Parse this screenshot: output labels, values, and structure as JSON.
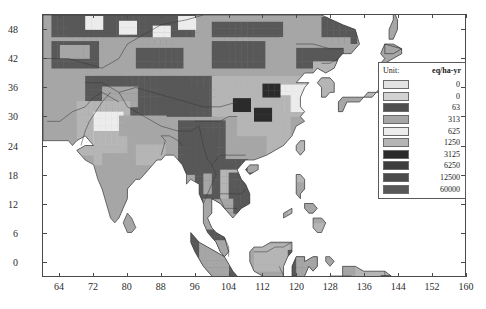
{
  "chart_data": {
    "type": "heatmap",
    "title": "",
    "subtitle": "",
    "xlabel": "",
    "ylabel": "",
    "xlim": [
      60,
      160
    ],
    "ylim": [
      -3,
      51
    ],
    "x_ticks": [
      "64",
      "72",
      "80",
      "88",
      "96",
      "104",
      "112",
      "120",
      "128",
      "136",
      "144",
      "152",
      "160"
    ],
    "y_ticks": [
      "0",
      "6",
      "12",
      "18",
      "24",
      "30",
      "36",
      "42",
      "48"
    ],
    "grid": false,
    "legend_position": "inside-top-right",
    "region": "Asia",
    "legend": {
      "unit_label": "Unit:",
      "unit_value": "eq/ha-yr",
      "entries": [
        {
          "value": "0",
          "color": "#e2e2e2"
        },
        {
          "value": "0",
          "color": "#d2d2d2"
        },
        {
          "value": "63",
          "color": "#4f4f4f"
        },
        {
          "value": "313",
          "color": "#a6a6a6"
        },
        {
          "value": "625",
          "color": "#ececec"
        },
        {
          "value": "1250",
          "color": "#b5b5b5"
        },
        {
          "value": "3125",
          "color": "#2b2b2b"
        },
        {
          "value": "6250",
          "color": "#3d3d3d"
        },
        {
          "value": "12500",
          "color": "#4a4a4a"
        },
        {
          "value": "60000",
          "color": "#585858"
        }
      ]
    },
    "colors": {
      "ocean": "#ffffff",
      "frame": "#4a4a4a",
      "coastline": "#3a3a3a",
      "text": "#1a1a1a",
      "class_0a": "#e2e2e2",
      "class_0b": "#d2d2d2",
      "class_63": "#4f4f4f",
      "class_313": "#a6a6a6",
      "class_625": "#ececec",
      "class_1250": "#b5b5b5",
      "class_3125": "#2b2b2b",
      "class_6250": "#3d3d3d",
      "class_12500": "#4a4a4a",
      "class_60000": "#585858"
    }
  }
}
